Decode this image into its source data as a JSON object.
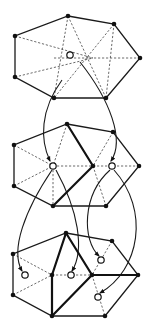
{
  "diagram": {
    "panels": [
      {
        "id": "panel-1",
        "outline": [
          [
            68,
            16
          ],
          [
            114,
            24
          ],
          [
            140,
            58
          ],
          [
            106,
            98
          ],
          [
            54,
            98
          ],
          [
            15,
            77
          ],
          [
            15,
            36
          ]
        ],
        "dashed_lines": [
          [
            [
              68,
              16
            ],
            [
              54,
              98
            ]
          ],
          [
            [
              68,
              16
            ],
            [
              106,
              98
            ]
          ],
          [
            [
              114,
              24
            ],
            [
              54,
              98
            ]
          ],
          [
            [
              15,
              36
            ],
            [
              93,
              58
            ]
          ],
          [
            [
              15,
              77
            ],
            [
              93,
              58
            ]
          ],
          [
            [
              54,
              58
            ],
            [
              140,
              58
            ]
          ],
          [
            [
              114,
              24
            ],
            [
              106,
              98
            ]
          ]
        ],
        "bold_lines": [],
        "solid_vertices": [],
        "hollow_vertices": [
          [
            70,
            55
          ]
        ]
      },
      {
        "id": "panel-2",
        "outline": [
          [
            67,
            124
          ],
          [
            113,
            132
          ],
          [
            139,
            166
          ],
          [
            106,
            206
          ],
          [
            53,
            206
          ],
          [
            14,
            186
          ],
          [
            14,
            145
          ]
        ],
        "dashed_lines": [
          [
            [
              14,
              145
            ],
            [
              53,
              166
            ]
          ],
          [
            [
              14,
              186
            ],
            [
              53,
              166
            ]
          ],
          [
            [
              53,
              166
            ],
            [
              139,
              166
            ]
          ],
          [
            [
              67,
              124
            ],
            [
              53,
              166
            ]
          ],
          [
            [
              53,
              166
            ],
            [
              53,
              206
            ]
          ],
          [
            [
              113,
              132
            ],
            [
              93,
              166
            ]
          ],
          [
            [
              93,
              166
            ],
            [
              106,
              206
            ]
          ]
        ],
        "bold_lines": [
          [
            [
              67,
              124
            ],
            [
              93,
              166
            ]
          ],
          [
            [
              93,
              166
            ],
            [
              53,
              206
            ]
          ]
        ],
        "solid_vertices": [
          [
            93,
            166
          ]
        ],
        "hollow_vertices": [
          [
            53,
            166
          ],
          [
            112,
            166
          ]
        ]
      },
      {
        "id": "panel-3",
        "outline": [
          [
            66,
            233
          ],
          [
            112,
            241
          ],
          [
            138,
            275
          ],
          [
            105,
            316
          ],
          [
            52,
            316
          ],
          [
            13,
            295
          ],
          [
            13,
            254
          ]
        ],
        "dashed_lines": [
          [
            [
              13,
              254
            ],
            [
              52,
              275
            ]
          ],
          [
            [
              13,
              295
            ],
            [
              52,
              275
            ]
          ],
          [
            [
              52,
              275
            ],
            [
              92,
              275
            ]
          ],
          [
            [
              112,
              241
            ],
            [
              92,
              275
            ]
          ],
          [
            [
              92,
              275
            ],
            [
              105,
              316
            ]
          ]
        ],
        "bold_lines": [
          [
            [
              66,
              233
            ],
            [
              52,
              275
            ]
          ],
          [
            [
              52,
              275
            ],
            [
              52,
              316
            ]
          ],
          [
            [
              66,
              233
            ],
            [
              92,
              275
            ]
          ],
          [
            [
              92,
              275
            ],
            [
              52,
              316
            ]
          ],
          [
            [
              92,
              275
            ],
            [
              138,
              275
            ]
          ]
        ],
        "solid_vertices": [
          [
            52,
            275
          ],
          [
            92,
            275
          ]
        ],
        "hollow_vertices": [
          [
            25,
            275
          ],
          [
            71,
            275
          ],
          [
            101,
            260
          ],
          [
            98,
            297
          ]
        ]
      }
    ],
    "arrows": [
      {
        "from": [
          54,
          98
        ],
        "to": [
          50,
          162
        ],
        "path": "M62,80 C40,110 40,140 50,161"
      },
      {
        "from": [
          106,
          98
        ],
        "to": [
          110,
          162
        ],
        "path": "M80,62 C110,100 125,140 111,161"
      },
      {
        "from": [
          53,
          166
        ],
        "to": [
          23,
          271
        ],
        "path": "M52,170 C25,210 10,250 22,271"
      },
      {
        "from": [
          53,
          166
        ],
        "to": [
          70,
          271
        ],
        "path": "M56,170 C78,210 85,250 72,271"
      },
      {
        "from": [
          112,
          166
        ],
        "to": [
          99,
          256
        ],
        "path": "M110,170 C82,195 82,240 99,256"
      },
      {
        "from": [
          112,
          166
        ],
        "to": [
          99,
          293
        ],
        "path": "M114,170 C150,210 140,270 100,293"
      }
    ]
  }
}
